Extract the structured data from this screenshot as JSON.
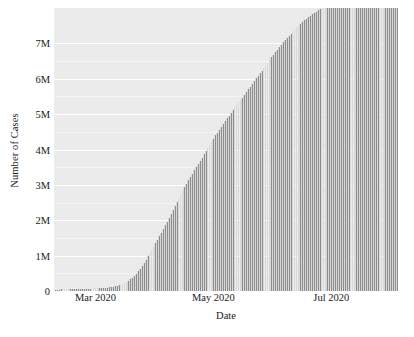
{
  "chart_data": {
    "type": "bar",
    "title": "",
    "subtitle": "",
    "xlabel": "Date",
    "ylabel": "Number of Cases",
    "grid": true,
    "legend": null,
    "bar_color": "#8c8c8c",
    "panel_color": "#ebebeb",
    "gridline_color": "#ffffff",
    "xlim": [
      "2020-02-09",
      "2020-08-04"
    ],
    "ylim": [
      0,
      8000000
    ],
    "y_ticks": [
      0,
      1000000,
      2000000,
      3000000,
      4000000,
      5000000,
      6000000,
      7000000
    ],
    "y_tick_labels": [
      "0",
      "1M",
      "2M",
      "3M",
      "4M",
      "5M",
      "6M",
      "7M"
    ],
    "x_ticks": [
      "2020-03-01",
      "2020-05-01",
      "2020-07-01"
    ],
    "x_tick_labels": [
      "Mar 2020",
      "May 2020",
      "Jul 2020"
    ],
    "categories": [
      "2020-02-09",
      "2020-02-10",
      "2020-02-11",
      "2020-02-12",
      "2020-02-13",
      "2020-02-14",
      "2020-02-15",
      "2020-02-16",
      "2020-02-17",
      "2020-02-18",
      "2020-02-19",
      "2020-02-20",
      "2020-02-21",
      "2020-02-22",
      "2020-02-23",
      "2020-02-24",
      "2020-02-25",
      "2020-02-26",
      "2020-02-27",
      "2020-02-28",
      "2020-02-29",
      "2020-03-01",
      "2020-03-02",
      "2020-03-03",
      "2020-03-04",
      "2020-03-05",
      "2020-03-06",
      "2020-03-07",
      "2020-03-08",
      "2020-03-09",
      "2020-03-10",
      "2020-03-11",
      "2020-03-12",
      "2020-03-13",
      "2020-03-14",
      "2020-03-15",
      "2020-03-16",
      "2020-03-17",
      "2020-03-18",
      "2020-03-19",
      "2020-03-20",
      "2020-03-21",
      "2020-03-22",
      "2020-03-23",
      "2020-03-24",
      "2020-03-25",
      "2020-03-26",
      "2020-03-27",
      "2020-03-28",
      "2020-03-29",
      "2020-03-30",
      "2020-03-31",
      "2020-04-01",
      "2020-04-02",
      "2020-04-03",
      "2020-04-04",
      "2020-04-05",
      "2020-04-06",
      "2020-04-07",
      "2020-04-08",
      "2020-04-09",
      "2020-04-10",
      "2020-04-11",
      "2020-04-12",
      "2020-04-13",
      "2020-04-14",
      "2020-04-15",
      "2020-04-16",
      "2020-04-17",
      "2020-04-18",
      "2020-04-19",
      "2020-04-20",
      "2020-04-21",
      "2020-04-22",
      "2020-04-23",
      "2020-04-24",
      "2020-04-25",
      "2020-04-26",
      "2020-04-27",
      "2020-04-28",
      "2020-04-29",
      "2020-04-30",
      "2020-05-01",
      "2020-05-02",
      "2020-05-03",
      "2020-05-04",
      "2020-05-05",
      "2020-05-06",
      "2020-05-07",
      "2020-05-08",
      "2020-05-09",
      "2020-05-10",
      "2020-05-11",
      "2020-05-12",
      "2020-05-13",
      "2020-05-14",
      "2020-05-15",
      "2020-05-16",
      "2020-05-17",
      "2020-05-18",
      "2020-05-19",
      "2020-05-20",
      "2020-05-21",
      "2020-05-22",
      "2020-05-23",
      "2020-05-24",
      "2020-05-25",
      "2020-05-26",
      "2020-05-27",
      "2020-05-28",
      "2020-05-29",
      "2020-05-30",
      "2020-05-31",
      "2020-06-01",
      "2020-06-02",
      "2020-06-03",
      "2020-06-04",
      "2020-06-05",
      "2020-06-06",
      "2020-06-07",
      "2020-06-08",
      "2020-06-09",
      "2020-06-10",
      "2020-06-11",
      "2020-06-12",
      "2020-06-13",
      "2020-06-14",
      "2020-06-15",
      "2020-06-16",
      "2020-06-17",
      "2020-06-18",
      "2020-06-19",
      "2020-06-20",
      "2020-06-21",
      "2020-06-22",
      "2020-06-23",
      "2020-06-24",
      "2020-06-25",
      "2020-06-26",
      "2020-06-27",
      "2020-06-28",
      "2020-06-29",
      "2020-06-30",
      "2020-07-01",
      "2020-07-02",
      "2020-07-03",
      "2020-07-04",
      "2020-07-05",
      "2020-07-06",
      "2020-07-07",
      "2020-07-08",
      "2020-07-09",
      "2020-07-10",
      "2020-07-11",
      "2020-07-12",
      "2020-07-13",
      "2020-07-14",
      "2020-07-15",
      "2020-07-16",
      "2020-07-17",
      "2020-07-18",
      "2020-07-19",
      "2020-07-20",
      "2020-07-21",
      "2020-07-22",
      "2020-07-23",
      "2020-07-24",
      "2020-07-25",
      "2020-07-26",
      "2020-07-27",
      "2020-07-28",
      "2020-07-29",
      "2020-07-30",
      "2020-07-31",
      "2020-08-01",
      "2020-08-02",
      "2020-08-03",
      "2020-08-04"
    ],
    "values": [
      38000,
      40000,
      42000,
      45000,
      47000,
      49000,
      51000,
      52000,
      53000,
      54000,
      55000,
      56000,
      57000,
      58000,
      59000,
      61000,
      63000,
      65000,
      67000,
      69000,
      72000,
      75000,
      78000,
      81000,
      85000,
      89000,
      94000,
      99000,
      105000,
      112000,
      120000,
      130000,
      142000,
      157000,
      176000,
      200000,
      228000,
      260000,
      295000,
      335000,
      380000,
      430000,
      490000,
      560000,
      630000,
      710000,
      800000,
      890000,
      980000,
      1070000,
      1160000,
      1250000,
      1350000,
      1450000,
      1550000,
      1650000,
      1760000,
      1860000,
      1960000,
      2070000,
      2180000,
      2290000,
      2400000,
      2510000,
      2620000,
      2730000,
      2830000,
      2930000,
      3030000,
      3130000,
      3230000,
      3320000,
      3410000,
      3500000,
      3590000,
      3680000,
      3770000,
      3860000,
      3950000,
      4040000,
      4130000,
      4220000,
      4310000,
      4400000,
      4480000,
      4560000,
      4640000,
      4720000,
      4800000,
      4880000,
      4960000,
      5040000,
      5120000,
      5190000,
      5260000,
      5330000,
      5400000,
      5470000,
      5540000,
      5620000,
      5700000,
      5780000,
      5860000,
      5940000,
      6020000,
      6090000,
      6160000,
      6230000,
      6300000,
      6370000,
      6450000,
      6530000,
      6610000,
      6680000,
      6750000,
      6820000,
      6890000,
      6960000,
      7030000,
      7090000,
      7150000,
      7210000,
      7270000,
      7330000,
      7390000,
      7450000,
      7500000,
      7550000,
      7600000,
      7650000,
      7700000,
      7740000,
      7780000,
      7820000,
      7860000,
      7900000,
      7930000,
      7960000,
      7990000,
      8020000,
      8050000,
      8080000,
      8110000,
      8140000,
      8170000,
      8200000,
      8230000,
      8260000,
      8290000,
      8320000,
      8350000,
      8380000,
      8410000,
      8440000,
      8470000,
      8500000,
      8530000,
      8560000,
      8590000,
      8620000,
      8650000,
      8680000,
      8710000,
      8740000,
      8770000,
      8800000,
      8830000,
      8860000,
      8890000,
      8920000,
      8950000,
      8980000,
      9010000,
      9040000,
      9070000,
      9100000,
      9130000,
      9160000
    ]
  }
}
